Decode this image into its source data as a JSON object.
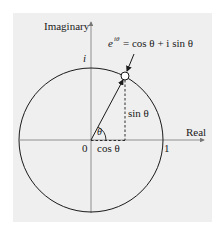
{
  "diagram": {
    "axes": {
      "horizontal_label": "Real",
      "vertical_label": "Imaginary"
    },
    "tick_labels": {
      "origin": "0",
      "real_one": "1",
      "imag_one": "i"
    },
    "point_label": {
      "e": "e",
      "exponent": "iθ",
      "rest": "= cos θ + i sin θ"
    },
    "angle_label": "θ",
    "cos_label": "cos θ",
    "sin_label": "sin θ",
    "colors": {
      "background": "#efefef",
      "stroke": "#1a1a1a",
      "axis": "#555555",
      "point_fill": "#ffffff"
    }
  }
}
